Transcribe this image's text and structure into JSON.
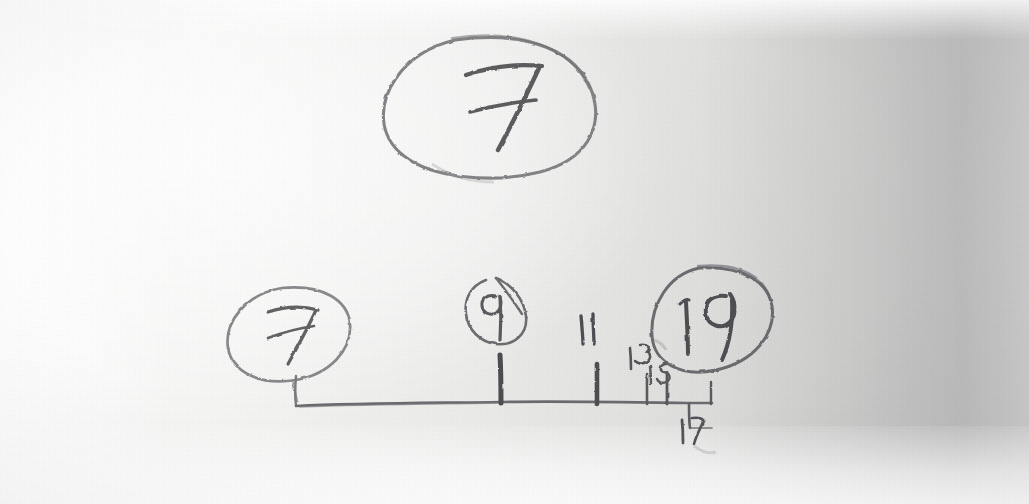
{
  "image": {
    "kind": "photograph-of-handwritten-pencil-sketch",
    "medium": "pencil on white paper",
    "description": "Hand-drawn number line with circled numbers and odd-number tick labels",
    "width_px": 1029,
    "height_px": 504,
    "ink_color": "#6f6f72",
    "ink_color_dark": "#4a4a4d",
    "paper_color": "#f2f2f1",
    "shadow_color": "#cfcfce"
  },
  "sketch": {
    "title_bubble": {
      "name": "circled-seven-top",
      "text": "7",
      "glyph_style": "crossed-seven",
      "shape": "ellipse",
      "center": [
        488,
        108
      ],
      "radius": [
        105,
        70
      ]
    },
    "circled_values": [
      {
        "name": "circled-seven-left",
        "text": "7",
        "glyph_style": "crossed-seven",
        "shape": "ellipse",
        "center": [
          288,
          334
        ],
        "radius": [
          62,
          48
        ]
      },
      {
        "name": "circled-nine",
        "text": "9",
        "glyph_style": "plain",
        "shape": "teardrop-oval",
        "center": [
          497,
          310
        ],
        "radius": [
          32,
          32
        ]
      },
      {
        "name": "circled-nineteen",
        "text": "19",
        "glyph_style": "plain",
        "shape": "ellipse",
        "center": [
          712,
          318
        ],
        "radius": [
          60,
          52
        ]
      }
    ],
    "number_line": {
      "name": "number-line",
      "start_x": 295,
      "end_x": 712,
      "y": 404,
      "left_end_cap": "upward hook",
      "right_end_cap": "short downward stroke"
    },
    "ticks": [
      {
        "name": "tick-9",
        "x": 500,
        "weight": "heavy",
        "height": 42,
        "label": "9"
      },
      {
        "name": "tick-11",
        "x": 597,
        "weight": "heavy",
        "height": 40,
        "label": "11"
      },
      {
        "name": "tick-13",
        "x": 648,
        "weight": "light",
        "height": 28,
        "label": "13"
      },
      {
        "name": "tick-15",
        "x": 667,
        "weight": "light",
        "height": 32,
        "label": "15"
      },
      {
        "name": "tick-17",
        "x": 690,
        "weight": "light",
        "height": 26,
        "label": "17"
      }
    ],
    "tick_labels": [
      {
        "name": "tick-label-11",
        "text": "11",
        "x": 586,
        "y": 328,
        "rotation": -4,
        "size": 26,
        "position": "above-line"
      },
      {
        "name": "tick-label-13",
        "text": "13",
        "x": 640,
        "y": 356,
        "rotation": -82,
        "size": 20,
        "position": "above-line"
      },
      {
        "name": "tick-label-15",
        "text": "15",
        "x": 663,
        "y": 378,
        "rotation": -84,
        "size": 19,
        "position": "above-line"
      },
      {
        "name": "tick-label-17",
        "text": "17",
        "x": 692,
        "y": 432,
        "rotation": -84,
        "size": 20,
        "position": "below-line"
      }
    ],
    "connectors": [
      {
        "name": "connector-seven-to-line",
        "from": [
          293,
          382
        ],
        "to": [
          297,
          400
        ]
      },
      {
        "name": "connector-nine-to-tick",
        "from": [
          500,
          344
        ],
        "to": [
          500,
          402
        ]
      }
    ],
    "sequence_read": [
      "7",
      "7",
      "9",
      "11",
      "13",
      "15",
      "17",
      "19"
    ]
  }
}
